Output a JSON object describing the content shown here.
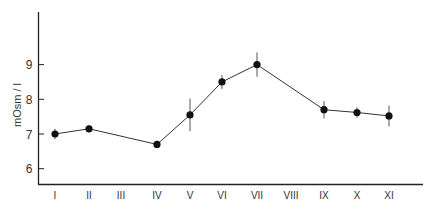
{
  "chart_data": {
    "type": "line",
    "title": "",
    "xlabel": "",
    "ylabel": "mOsm / l",
    "ylim": [
      5.5,
      10.4
    ],
    "grid": false,
    "legend": null,
    "categories": [
      "I",
      "II",
      "III",
      "IV",
      "V",
      "VI",
      "VII",
      "VIII",
      "IX",
      "X",
      "XI"
    ],
    "y_ticks": [
      6,
      7,
      8,
      9
    ],
    "series": [
      {
        "name": "mean",
        "x": [
          "I",
          "II",
          "IV",
          "V",
          "VI",
          "VII",
          "IX",
          "X",
          "XI"
        ],
        "values": [
          7.0,
          7.15,
          6.7,
          7.55,
          8.5,
          9.0,
          7.7,
          7.62,
          7.52
        ],
        "error": [
          0.15,
          0.1,
          0.1,
          0.47,
          0.2,
          0.35,
          0.25,
          0.15,
          0.3
        ]
      }
    ]
  },
  "axis": {
    "y_title": "mOsm / l"
  }
}
